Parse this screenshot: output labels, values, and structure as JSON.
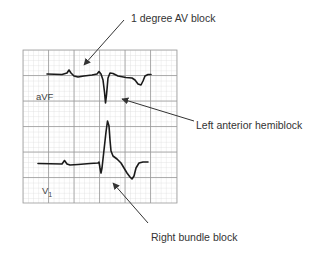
{
  "diagram": {
    "type": "ecg-annotated",
    "grid": {
      "minor_color": "#d6d6d6",
      "major_color": "#9a9a9a",
      "trace_color": "#1a1a1a"
    },
    "leads": [
      {
        "id": "avf",
        "label": "aVF"
      },
      {
        "id": "v1",
        "label": "V",
        "subscript": "1"
      }
    ],
    "annotations": [
      {
        "id": "av-block",
        "text": "1 degree AV block"
      },
      {
        "id": "lahb",
        "text": "Left anterior hemiblock"
      },
      {
        "id": "rbbb",
        "text": "Right bundle block"
      }
    ],
    "arrow_color": "#333333"
  }
}
